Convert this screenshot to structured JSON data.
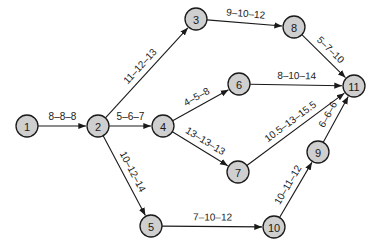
{
  "diagram": {
    "type": "activity-network",
    "node_fill": "#cfcfcf",
    "stroke": "#1a1a1a",
    "nodes": [
      {
        "id": "1",
        "label": "1",
        "x": 27,
        "y": 126
      },
      {
        "id": "2",
        "label": "2",
        "x": 98,
        "y": 126
      },
      {
        "id": "3",
        "label": "3",
        "x": 196,
        "y": 19
      },
      {
        "id": "4",
        "label": "4",
        "x": 163,
        "y": 126
      },
      {
        "id": "5",
        "label": "5",
        "x": 151,
        "y": 226
      },
      {
        "id": "6",
        "label": "6",
        "x": 239,
        "y": 84
      },
      {
        "id": "7",
        "label": "7",
        "x": 238,
        "y": 172
      },
      {
        "id": "8",
        "label": "8",
        "x": 294,
        "y": 27
      },
      {
        "id": "9",
        "label": "9",
        "x": 318,
        "y": 152
      },
      {
        "id": "10",
        "label": "10",
        "x": 274,
        "y": 227
      },
      {
        "id": "11",
        "label": "11",
        "x": 354,
        "y": 86
      }
    ],
    "edges": [
      {
        "from": "1",
        "to": "2",
        "label": "8–8–8"
      },
      {
        "from": "2",
        "to": "3",
        "label": "11–12–13"
      },
      {
        "from": "2",
        "to": "4",
        "label": "5–6–7"
      },
      {
        "from": "2",
        "to": "5",
        "label": "10–12–14"
      },
      {
        "from": "3",
        "to": "8",
        "label": "9–10–12"
      },
      {
        "from": "4",
        "to": "6",
        "label": "4–5–8"
      },
      {
        "from": "4",
        "to": "7",
        "label": "13–13–13"
      },
      {
        "from": "5",
        "to": "10",
        "label": "7–10–12"
      },
      {
        "from": "6",
        "to": "11",
        "label": "8–10–14"
      },
      {
        "from": "7",
        "to": "11",
        "label": "10.5–13–15.5"
      },
      {
        "from": "8",
        "to": "11",
        "label": "5–7–10"
      },
      {
        "from": "9",
        "to": "11",
        "label": "6–6–6"
      },
      {
        "from": "10",
        "to": "9",
        "label": "10–11–12"
      }
    ]
  }
}
